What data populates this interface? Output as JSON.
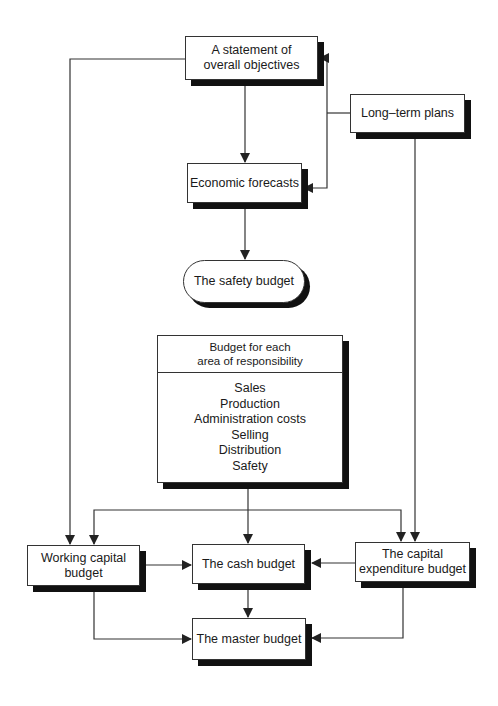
{
  "nodes": {
    "statement": {
      "lines": [
        "A statement of",
        "overall objectives"
      ]
    },
    "long_term": {
      "lines": [
        "Long–term plans"
      ]
    },
    "economic": {
      "lines": [
        "Economic forecasts"
      ]
    },
    "safety": {
      "lines": [
        "The safety budget"
      ]
    },
    "responsibility": {
      "header": [
        "Budget for each",
        "area of responsibility"
      ],
      "items": [
        "Sales",
        "Production",
        "Administration costs",
        "Selling",
        "Distribution",
        "Safety"
      ]
    },
    "working_capital": {
      "lines": [
        "Working capital",
        "budget"
      ]
    },
    "cash": {
      "lines": [
        "The cash budget"
      ]
    },
    "capital_expenditure": {
      "lines": [
        "The capital",
        "expenditure budget"
      ]
    },
    "master": {
      "lines": [
        "The master budget"
      ]
    }
  },
  "edges": [
    {
      "from": "statement",
      "to": "economic"
    },
    {
      "from": "long_term",
      "to": "statement"
    },
    {
      "from": "long_term",
      "to": "economic"
    },
    {
      "from": "economic",
      "to": "safety"
    },
    {
      "from": "statement",
      "to": "working_capital"
    },
    {
      "from": "long_term",
      "to": "capital_expenditure"
    },
    {
      "from": "responsibility",
      "to": "working_capital"
    },
    {
      "from": "responsibility",
      "to": "cash"
    },
    {
      "from": "responsibility",
      "to": "capital_expenditure"
    },
    {
      "from": "working_capital",
      "to": "cash"
    },
    {
      "from": "capital_expenditure",
      "to": "cash"
    },
    {
      "from": "cash",
      "to": "master"
    },
    {
      "from": "working_capital",
      "to": "master"
    },
    {
      "from": "capital_expenditure",
      "to": "master"
    }
  ],
  "colors": {
    "line": "#333333",
    "shadow": "#111111",
    "background": "#ffffff"
  }
}
